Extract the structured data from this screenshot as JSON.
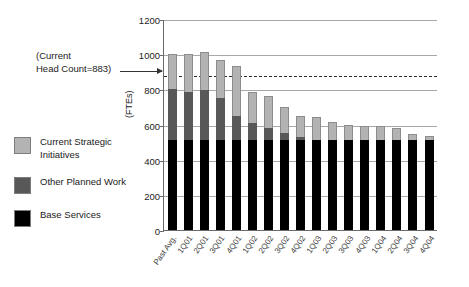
{
  "annotation": {
    "line1": "(Current",
    "line2": "Head Count=883)",
    "value": 883
  },
  "legend": {
    "items": [
      {
        "label": "Current Strategic Initiatives",
        "color": "#b3b3b3",
        "key": "csi"
      },
      {
        "label": "Other Planned Work",
        "color": "#585858",
        "key": "opw"
      },
      {
        "label": "Base Services",
        "color": "#000000",
        "key": "base"
      }
    ]
  },
  "axis": {
    "ylabel": "(FTEs)",
    "yticks": [
      "0",
      "200",
      "400",
      "600",
      "800",
      "1000",
      "1200"
    ]
  },
  "chart_data": {
    "type": "bar",
    "title": "",
    "xlabel": "",
    "ylabel": "(FTEs)",
    "ylim": [
      0,
      1200
    ],
    "ytick_step": 200,
    "grid": true,
    "stacked": true,
    "legend_position": "left",
    "categories": [
      "Past Avg.",
      "1Q01",
      "2Q01",
      "3Q01",
      "4Q01",
      "1Q02",
      "2Q02",
      "3Q02",
      "4Q02",
      "1Q03",
      "2Q03",
      "3Q03",
      "4Q03",
      "1Q04",
      "2Q04",
      "3Q04",
      "4Q04"
    ],
    "series": [
      {
        "name": "Base Services",
        "color": "#000000",
        "values": [
          510,
          510,
          510,
          510,
          510,
          510,
          510,
          510,
          510,
          510,
          510,
          510,
          510,
          510,
          510,
          510,
          510
        ]
      },
      {
        "name": "Other Planned Work",
        "color": "#585858",
        "values": [
          290,
          275,
          285,
          240,
          140,
          100,
          70,
          40,
          20,
          0,
          0,
          0,
          0,
          0,
          0,
          0,
          0
        ]
      },
      {
        "name": "Current Strategic Initiatives",
        "color": "#b3b3b3",
        "values": [
          200,
          215,
          215,
          215,
          285,
          175,
          180,
          150,
          120,
          130,
          105,
          90,
          80,
          80,
          70,
          35,
          25
        ]
      }
    ],
    "totals": [
      1000,
      1000,
      1010,
      965,
      935,
      785,
      760,
      700,
      650,
      640,
      615,
      600,
      590,
      590,
      580,
      545,
      535
    ],
    "annotations": [
      {
        "type": "hline",
        "value": 883,
        "style": "dashed",
        "label": "(Current Head Count=883)"
      }
    ]
  }
}
